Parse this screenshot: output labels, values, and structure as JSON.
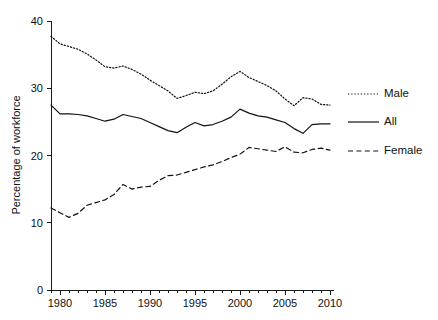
{
  "chart_data": {
    "type": "line",
    "title": "",
    "subtitle": "",
    "xlabel": "",
    "ylabel": "Percentage of workforce",
    "xlim": [
      1979,
      2010
    ],
    "ylim": [
      0,
      40
    ],
    "grid": false,
    "legend_position": "right",
    "x_major_ticks": [
      1980,
      1985,
      1990,
      1995,
      2000,
      2005,
      2010
    ],
    "x_tick_labels": [
      "1980",
      "1985",
      "1990",
      "1995",
      "2000",
      "2005",
      "2010"
    ],
    "x_minor_tick_step": 1,
    "y_ticks": [
      0,
      10,
      20,
      30,
      40
    ],
    "y_tick_labels": [
      "0",
      "10",
      "20",
      "30",
      "40"
    ],
    "x": [
      1979,
      1980,
      1981,
      1982,
      1983,
      1984,
      1985,
      1986,
      1987,
      1988,
      1989,
      1990,
      1991,
      1992,
      1993,
      1994,
      1995,
      1996,
      1997,
      1998,
      1999,
      2000,
      2001,
      2002,
      2003,
      2004,
      2005,
      2006,
      2007,
      2008,
      2009,
      2010
    ],
    "series": [
      {
        "name": "Male",
        "style": "dotted",
        "values": [
          37.7,
          36.6,
          36.2,
          35.8,
          35.1,
          34.2,
          33.2,
          33.0,
          33.3,
          32.8,
          32.1,
          31.2,
          30.4,
          29.6,
          28.5,
          28.9,
          29.4,
          29.2,
          29.6,
          30.6,
          31.7,
          32.5,
          31.6,
          31.0,
          30.4,
          29.6,
          28.4,
          27.4,
          28.6,
          28.4,
          27.6,
          27.5
        ]
      },
      {
        "name": "All",
        "style": "solid",
        "values": [
          27.5,
          26.2,
          26.2,
          26.1,
          25.9,
          25.5,
          25.1,
          25.4,
          26.1,
          25.8,
          25.5,
          24.9,
          24.3,
          23.7,
          23.4,
          24.2,
          24.9,
          24.4,
          24.6,
          25.1,
          25.7,
          26.9,
          26.3,
          25.9,
          25.7,
          25.3,
          24.9,
          24.0,
          23.3,
          24.6,
          24.7,
          24.7
        ]
      },
      {
        "name": "Female",
        "style": "dashed",
        "values": [
          12.2,
          11.5,
          10.8,
          11.4,
          12.6,
          13.0,
          13.4,
          14.2,
          15.7,
          15.0,
          15.3,
          15.4,
          16.3,
          17.0,
          17.1,
          17.5,
          17.9,
          18.3,
          18.6,
          19.1,
          19.7,
          20.2,
          21.2,
          21.0,
          20.8,
          20.6,
          21.3,
          20.5,
          20.4,
          20.9,
          21.1,
          20.8
        ]
      }
    ],
    "legend": [
      {
        "label": "Male",
        "style": "dotted"
      },
      {
        "label": "All",
        "style": "solid"
      },
      {
        "label": "Female",
        "style": "dashed"
      }
    ]
  }
}
